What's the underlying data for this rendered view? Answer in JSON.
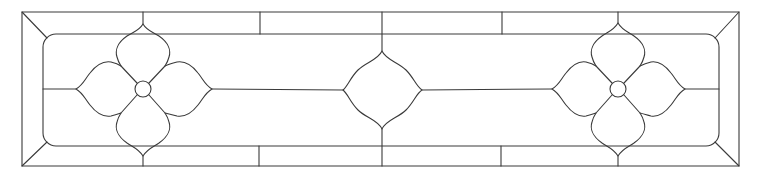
{
  "drawing": {
    "type": "stained-glass-transom-pattern",
    "line_color": "#3a3a3a",
    "background_color": "#ffffff",
    "outer_frame": {
      "x1": 22,
      "y1": 12,
      "x2": 739,
      "y2": 166
    },
    "inner_panel": {
      "x1": 43,
      "y1": 34,
      "x2": 719,
      "y2": 146,
      "corner_radius": 13
    },
    "border_dividers_x": [
      260,
      382,
      502
    ],
    "flowers": [
      {
        "name": "left-flower",
        "cx": 143,
        "cy": 89,
        "center_radius": 8
      },
      {
        "name": "right-flower",
        "cx": 618,
        "cy": 89,
        "center_radius": 8
      }
    ],
    "center_medallion": {
      "cx": 382,
      "cy": 90,
      "half_width": 39,
      "half_height": 39
    }
  }
}
